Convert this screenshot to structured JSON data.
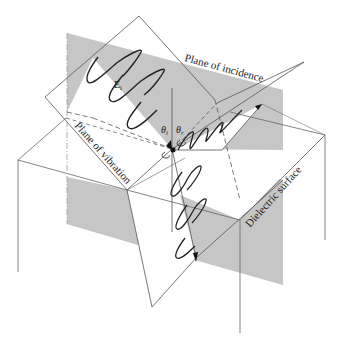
{
  "diagram": {
    "labels": {
      "plane_of_incidence": "Plane of incidence",
      "plane_of_vibration": "Plane of vibration",
      "dielectric_surface": "Dielectric surface",
      "incident_field": "E",
      "incident_field_sub": "i",
      "theta_i": "θ",
      "theta_i_sub": "i",
      "theta_r": "θ",
      "theta_r_sub": "r"
    },
    "colors": {
      "plane_gray": "#c4c4c4",
      "line": "#555555",
      "wave": "#222222",
      "background": "#ffffff"
    }
  }
}
